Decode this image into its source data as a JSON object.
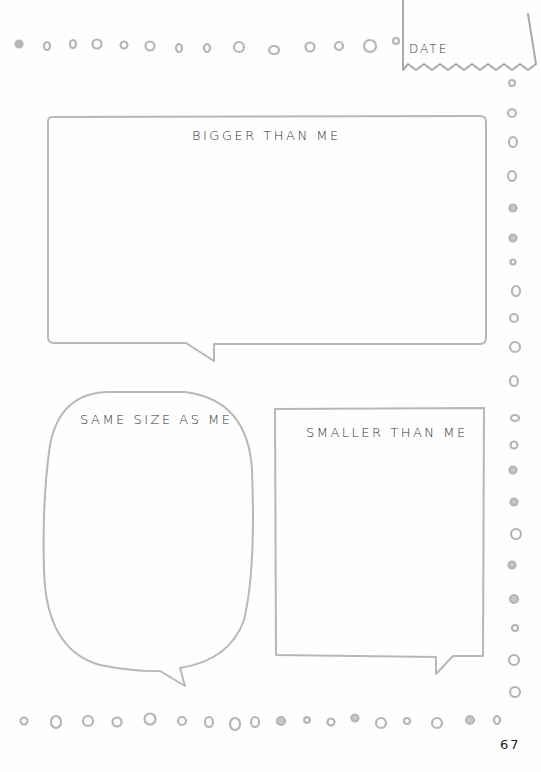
{
  "date_box": {
    "label": "DATE"
  },
  "bubbles": {
    "bigger": {
      "label": "BIGGER THAN ME"
    },
    "same": {
      "label": "SAME SIZE AS ME"
    },
    "smaller": {
      "label": "SMALLER THAN ME"
    }
  },
  "page_number": "67",
  "colors": {
    "outline": "#b8b8b8",
    "text": "#333333",
    "dots": "#b5b5b5"
  },
  "decorations": {
    "dot_border": "hand-drawn-circle-icons"
  }
}
